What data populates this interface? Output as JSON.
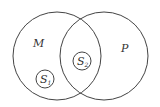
{
  "diagram": {
    "type": "venn",
    "sets": [
      {
        "id": "M",
        "label": "M"
      },
      {
        "id": "P",
        "label": "P"
      }
    ],
    "subsets": [
      {
        "id": "S1",
        "label": "S",
        "subscript": "1",
        "region": "M only"
      },
      {
        "id": "S2",
        "label": "S",
        "subscript": "2",
        "region": "M and P intersection"
      }
    ]
  }
}
